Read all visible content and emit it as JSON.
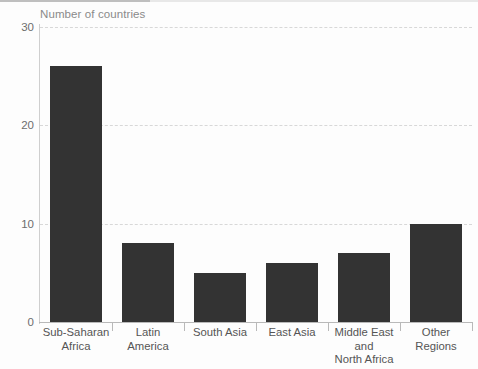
{
  "figure": {
    "title": "Number of countries"
  },
  "chart_data": {
    "type": "bar",
    "title": "Number of countries",
    "xlabel": "",
    "ylabel": "Number of countries",
    "ylim": [
      0,
      30
    ],
    "yticks": [
      "0",
      "10",
      "20",
      "30"
    ],
    "ytick_values": [
      0,
      10,
      20,
      30
    ],
    "grid": "horizontal dashed gridlines at 10, 20, 30",
    "legend": "none",
    "bar_color": "#333333",
    "categories": [
      "Sub-Saharan Africa",
      "Latin America",
      "South Asia",
      "East Asia",
      "Middle East and North Africa",
      "Other Regions"
    ],
    "category_lines": [
      [
        "Sub-Saharan",
        "Africa"
      ],
      [
        "Latin",
        "America"
      ],
      [
        "South Asia"
      ],
      [
        "East Asia"
      ],
      [
        "Middle East and",
        "North Africa"
      ],
      [
        "Other",
        "Regions"
      ]
    ],
    "values": [
      26,
      8,
      5,
      6,
      7,
      10
    ]
  }
}
